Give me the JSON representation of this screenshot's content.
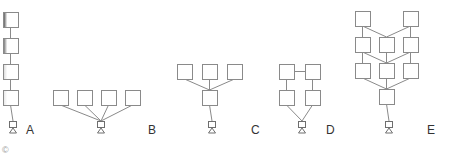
{
  "colors": {
    "stroke": "#8a8a8a",
    "label": "#333333",
    "shade_dark": "#4a4a4a",
    "shade_light": "#e6e6e6"
  },
  "box_size": 15,
  "panels": [
    {
      "id": "A",
      "label": "A",
      "label_pos": [
        26,
        124
      ],
      "boxes": [
        {
          "x": 3,
          "y": 12,
          "shade": "#4a4a4a"
        },
        {
          "x": 3,
          "y": 38,
          "shade": "#6a6a6a"
        },
        {
          "x": 3,
          "y": 64,
          "shade": "#d8d8d8"
        },
        {
          "x": 3,
          "y": 90,
          "shade": "#e6e6e6"
        }
      ],
      "links": [
        [
          0,
          1
        ],
        [
          1,
          2
        ],
        [
          2,
          3
        ]
      ],
      "sink": {
        "x": 10,
        "y": 121
      },
      "sink_from": [
        3
      ]
    },
    {
      "id": "B",
      "label": "B",
      "label_pos": [
        148,
        124
      ],
      "boxes": [
        {
          "x": 53,
          "y": 90
        },
        {
          "x": 77,
          "y": 90
        },
        {
          "x": 101,
          "y": 90
        },
        {
          "x": 125,
          "y": 90
        }
      ],
      "links": [],
      "sink": {
        "x": 98,
        "y": 121
      },
      "sink_from": [
        0,
        1,
        2,
        3
      ]
    },
    {
      "id": "C",
      "label": "C",
      "label_pos": [
        251,
        124
      ],
      "boxes": [
        {
          "x": 177,
          "y": 64
        },
        {
          "x": 202,
          "y": 64
        },
        {
          "x": 227,
          "y": 64
        },
        {
          "x": 202,
          "y": 90
        }
      ],
      "links": [
        [
          0,
          3
        ],
        [
          1,
          3
        ],
        [
          2,
          3
        ]
      ],
      "sink": {
        "x": 209,
        "y": 121
      },
      "sink_from": [
        3
      ]
    },
    {
      "id": "D",
      "label": "D",
      "label_pos": [
        326,
        124
      ],
      "boxes": [
        {
          "x": 279,
          "y": 64
        },
        {
          "x": 305,
          "y": 64
        },
        {
          "x": 279,
          "y": 90
        },
        {
          "x": 305,
          "y": 90
        }
      ],
      "links": [
        [
          0,
          1,
          "h"
        ],
        [
          0,
          2
        ],
        [
          1,
          3
        ]
      ],
      "sink": {
        "x": 299,
        "y": 121
      },
      "sink_from": [
        2,
        3
      ]
    },
    {
      "id": "E",
      "label": "E",
      "label_pos": [
        427,
        124
      ],
      "boxes": [
        {
          "x": 355,
          "y": 11
        },
        {
          "x": 403,
          "y": 11
        },
        {
          "x": 355,
          "y": 37
        },
        {
          "x": 379,
          "y": 37
        },
        {
          "x": 403,
          "y": 37
        },
        {
          "x": 355,
          "y": 63
        },
        {
          "x": 379,
          "y": 63
        },
        {
          "x": 403,
          "y": 63
        },
        {
          "x": 379,
          "y": 89
        }
      ],
      "links": [
        [
          0,
          2
        ],
        [
          0,
          3
        ],
        [
          1,
          3
        ],
        [
          1,
          4
        ],
        [
          2,
          5
        ],
        [
          2,
          6
        ],
        [
          3,
          6
        ],
        [
          4,
          6
        ],
        [
          4,
          7
        ],
        [
          5,
          8
        ],
        [
          6,
          8
        ],
        [
          7,
          8
        ]
      ],
      "sink": {
        "x": 386,
        "y": 121
      },
      "sink_from": [
        8
      ]
    }
  ],
  "copyright": "©"
}
